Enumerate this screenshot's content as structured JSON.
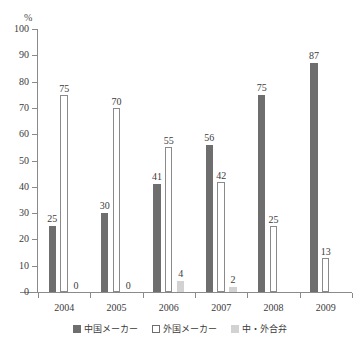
{
  "chart_data": {
    "type": "bar",
    "title": "",
    "xlabel": "",
    "ylabel": "%",
    "unit_label": "%",
    "ylim": [
      0,
      100
    ],
    "ytick_step": 10,
    "yticks": [
      100,
      90,
      80,
      70,
      60,
      50,
      40,
      30,
      20,
      10,
      0
    ],
    "categories": [
      "2004",
      "2005",
      "2006",
      "2007",
      "2008",
      "2009"
    ],
    "grid": false,
    "legend_position": "bottom",
    "series": [
      {
        "name": "中国メーカー",
        "color": "#6e6e6e",
        "values": [
          25,
          30,
          41,
          56,
          75,
          87
        ],
        "labels": [
          "25",
          "30",
          "41",
          "56",
          "75",
          "87"
        ]
      },
      {
        "name": "外国メーカー",
        "color": "#ffffff",
        "values": [
          75,
          70,
          55,
          42,
          25,
          13
        ],
        "labels": [
          "75",
          "70",
          "55",
          "42",
          "25",
          "13"
        ]
      },
      {
        "name": "中・外合弁",
        "color": "#d2d2d2",
        "values": [
          0,
          0,
          4,
          2,
          0,
          0
        ],
        "labels": [
          "0",
          "0",
          "4",
          "2",
          "",
          ""
        ]
      }
    ]
  },
  "colors": {
    "series_domestic": "#6e6e6e",
    "series_foreign": "#ffffff",
    "series_joint_venture": "#d2d2d2",
    "axis": "#8a8a8a",
    "text": "#3b3b3b",
    "background": "#ffffff"
  }
}
